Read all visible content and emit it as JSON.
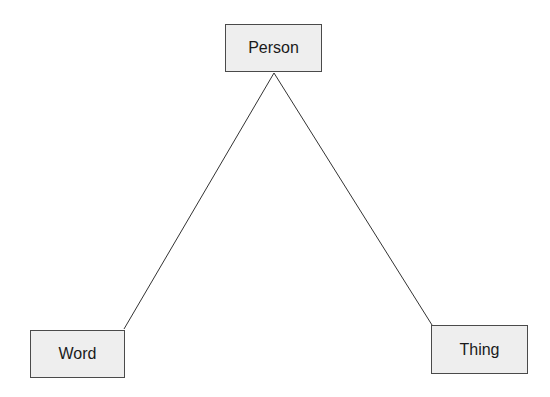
{
  "diagram": {
    "type": "triangle",
    "nodes": [
      {
        "id": "person",
        "label": "Person"
      },
      {
        "id": "word",
        "label": "Word"
      },
      {
        "id": "thing",
        "label": "Thing"
      }
    ],
    "edges": [
      {
        "from": "person",
        "to": "word"
      },
      {
        "from": "person",
        "to": "thing"
      }
    ],
    "colors": {
      "node_fill": "#eeeeee",
      "node_border": "#4a4a4a",
      "edge": "#333333",
      "text": "#1a1a1a"
    }
  }
}
